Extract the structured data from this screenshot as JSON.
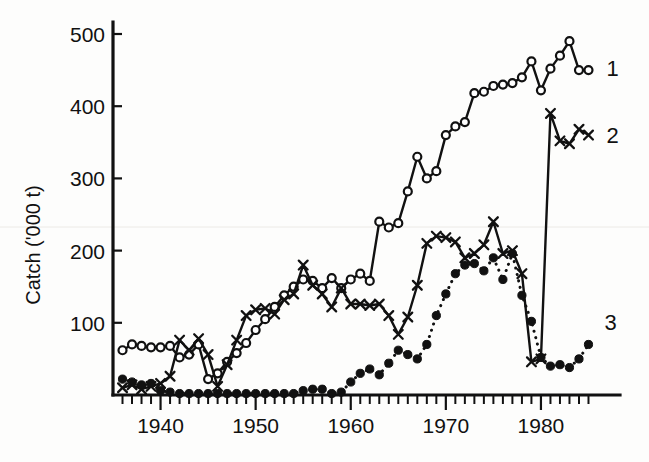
{
  "figure": {
    "background_color": "#fdfdfc",
    "ink_color": "#111111"
  },
  "axes": {
    "y_axis_title": "Catch ('000 t)",
    "y_ticks": [
      "100",
      "200",
      "300",
      "400",
      "500"
    ],
    "y_tick_values": [
      100,
      200,
      300,
      400,
      500
    ],
    "x_ticks": [
      "1940",
      "1950",
      "1960",
      "1970",
      "1980"
    ],
    "x_tick_values": [
      1940,
      1950,
      1960,
      1970,
      1980
    ],
    "x_minor_tick_interval": 1,
    "x_range": [
      1935,
      1986
    ],
    "y_range": [
      0,
      520
    ]
  },
  "series_labels": {
    "one": "1",
    "two": "2",
    "three": "3"
  },
  "chart_data": {
    "type": "line",
    "title": "",
    "xlabel": "",
    "ylabel": "Catch ('000 t)",
    "xlim": [
      1935,
      1986
    ],
    "ylim": [
      0,
      520
    ],
    "grid": false,
    "legend_position": "right-end-of-line",
    "x_tick_labels": [
      "1940",
      "1950",
      "1960",
      "1970",
      "1980"
    ],
    "y_tick_labels": [
      "100",
      "200",
      "300",
      "400",
      "500"
    ],
    "annotations": [
      {
        "text": "1",
        "series": "1",
        "position": "end-of-line"
      },
      {
        "text": "2",
        "series": "2",
        "position": "end-of-line"
      },
      {
        "text": "3",
        "series": "3",
        "position": "end-of-line"
      }
    ],
    "series": [
      {
        "name": "1",
        "marker": "open-circle",
        "linestyle": "solid",
        "x": [
          1936,
          1937,
          1938,
          1939,
          1940,
          1941,
          1942,
          1943,
          1944,
          1945,
          1946,
          1947,
          1948,
          1949,
          1950,
          1951,
          1952,
          1953,
          1954,
          1955,
          1956,
          1957,
          1958,
          1959,
          1960,
          1961,
          1962,
          1963,
          1964,
          1965,
          1966,
          1967,
          1968,
          1969,
          1970,
          1971,
          1972,
          1973,
          1974,
          1975,
          1976,
          1977,
          1978,
          1979,
          1980,
          1981,
          1982,
          1983,
          1984,
          1985
        ],
        "y": [
          62,
          70,
          68,
          66,
          66,
          68,
          52,
          56,
          70,
          22,
          30,
          46,
          58,
          72,
          90,
          105,
          122,
          138,
          150,
          160,
          158,
          148,
          162,
          148,
          160,
          168,
          158,
          240,
          232,
          238,
          282,
          330,
          300,
          310,
          360,
          372,
          378,
          418,
          420,
          428,
          430,
          432,
          440,
          462,
          422,
          452,
          470,
          490,
          450,
          450
        ]
      },
      {
        "name": "2",
        "marker": "cross",
        "linestyle": "solid",
        "x": [
          1936,
          1937,
          1938,
          1939,
          1940,
          1941,
          1942,
          1943,
          1944,
          1945,
          1946,
          1947,
          1948,
          1949,
          1950,
          1951,
          1952,
          1953,
          1954,
          1955,
          1956,
          1957,
          1958,
          1959,
          1960,
          1961,
          1962,
          1963,
          1964,
          1965,
          1966,
          1967,
          1968,
          1969,
          1970,
          1971,
          1972,
          1973,
          1974,
          1975,
          1976,
          1977,
          1978,
          1979,
          1980,
          1981,
          1982,
          1983,
          1984,
          1985
        ],
        "y": [
          10,
          14,
          8,
          12,
          16,
          26,
          76,
          62,
          78,
          56,
          12,
          42,
          76,
          110,
          118,
          120,
          112,
          132,
          140,
          180,
          152,
          140,
          122,
          148,
          126,
          126,
          124,
          126,
          110,
          84,
          108,
          152,
          210,
          220,
          218,
          212,
          190,
          196,
          208,
          240,
          196,
          200,
          168,
          46,
          50,
          390,
          352,
          348,
          368,
          360
        ]
      },
      {
        "name": "3",
        "marker": "filled-circle",
        "linestyle": "dotted",
        "x": [
          1936,
          1937,
          1938,
          1939,
          1940,
          1941,
          1942,
          1943,
          1944,
          1945,
          1946,
          1947,
          1948,
          1949,
          1950,
          1951,
          1952,
          1953,
          1954,
          1955,
          1956,
          1957,
          1958,
          1959,
          1960,
          1961,
          1962,
          1963,
          1964,
          1965,
          1966,
          1967,
          1968,
          1969,
          1970,
          1971,
          1972,
          1973,
          1974,
          1975,
          1976,
          1977,
          1978,
          1979,
          1980,
          1981,
          1982,
          1983,
          1984,
          1985
        ],
        "y": [
          22,
          18,
          14,
          16,
          6,
          4,
          2,
          2,
          2,
          2,
          2,
          2,
          2,
          2,
          2,
          2,
          2,
          2,
          2,
          6,
          8,
          8,
          2,
          4,
          18,
          30,
          36,
          28,
          44,
          62,
          56,
          50,
          70,
          110,
          140,
          168,
          180,
          182,
          172,
          190,
          160,
          196,
          138,
          102,
          52,
          40,
          42,
          38,
          50,
          70
        ]
      }
    ]
  }
}
